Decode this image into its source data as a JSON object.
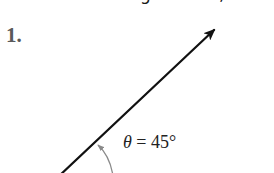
{
  "page": {
    "top_fragment": {
      "left_glyph": "g",
      "right_glyph": ","
    },
    "problem": {
      "number": "1.",
      "figure": {
        "type": "angle-in-standard-position",
        "ray_direction_degrees": 45,
        "angle_label": {
          "symbol": "θ",
          "equals": "=",
          "value": "45°"
        },
        "colors": {
          "ray": "#111111",
          "arc": "#8a8a8a",
          "label": "#222222",
          "number": "#5a5a5a"
        }
      }
    }
  }
}
